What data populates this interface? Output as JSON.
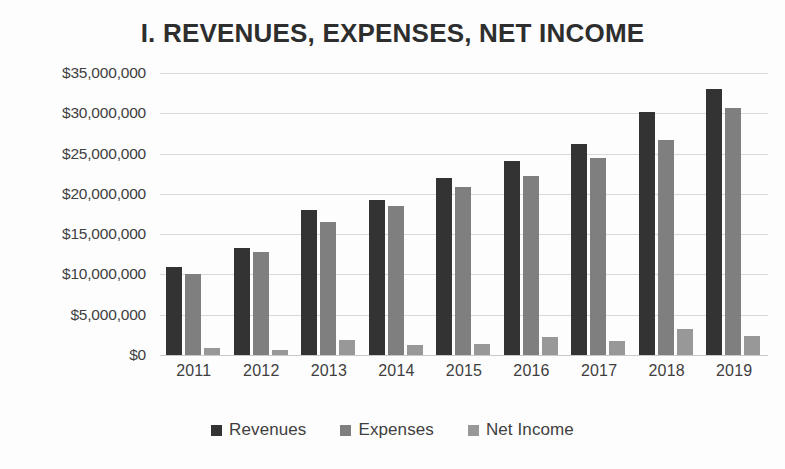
{
  "chart_data": {
    "type": "bar",
    "title": "I. REVENUES, EXPENSES, NET INCOME",
    "xlabel": "",
    "ylabel": "",
    "categories": [
      "2011",
      "2012",
      "2013",
      "2014",
      "2015",
      "2016",
      "2017",
      "2018",
      "2019"
    ],
    "series": [
      {
        "name": "Revenues",
        "color": "#333333",
        "values": [
          10900000,
          13300000,
          18000000,
          19300000,
          22000000,
          24100000,
          26200000,
          30100000,
          33000000
        ]
      },
      {
        "name": "Expenses",
        "color": "#7f7f7f",
        "values": [
          10100000,
          12800000,
          16500000,
          18500000,
          20900000,
          22200000,
          24500000,
          26700000,
          30700000
        ]
      },
      {
        "name": "Net Income",
        "color": "#989898",
        "values": [
          900000,
          600000,
          1900000,
          1200000,
          1400000,
          2200000,
          1700000,
          3200000,
          2300000
        ]
      }
    ],
    "ylim": [
      0,
      35000000
    ],
    "ytick_values": [
      0,
      5000000,
      10000000,
      15000000,
      20000000,
      25000000,
      30000000,
      35000000
    ],
    "ytick_labels": [
      "$0",
      "$5,000,000",
      "$10,000,000",
      "$15,000,000",
      "$20,000,000",
      "$25,000,000",
      "$30,000,000",
      "$35,000,000"
    ],
    "grid": true,
    "legend_position": "bottom",
    "legend": [
      "Revenues",
      "Expenses",
      "Net Income"
    ]
  }
}
